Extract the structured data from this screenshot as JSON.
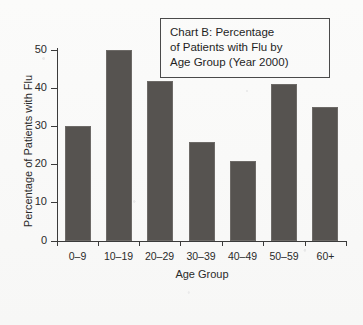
{
  "chart_data": {
    "type": "bar",
    "title": "Chart B: Percentage of Patients with Flu by Age Group (Year 2000)",
    "title_lines": [
      "Chart B: Percentage",
      "of Patients with Flu by",
      "Age Group (Year 2000)"
    ],
    "categories": [
      "0–9",
      "10–19",
      "20–29",
      "30–39",
      "40–49",
      "50–59",
      "60+"
    ],
    "values": [
      30,
      50,
      42,
      26,
      21,
      41,
      35
    ],
    "xlabel": "Age Group",
    "ylabel": "Percentage of Patients with Flu",
    "ylim": [
      0,
      50
    ],
    "yticks": [
      0,
      10,
      20,
      30,
      40,
      50
    ],
    "ytick_labels": [
      "0",
      "10",
      "20",
      "30",
      "40",
      "50"
    ],
    "grid": false,
    "legend": null,
    "bar_color": "#565350",
    "axis_color": "#3b3b3b",
    "background_color": "#fbfbfa"
  }
}
